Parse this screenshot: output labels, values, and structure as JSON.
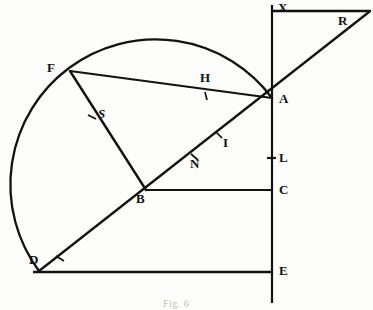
{
  "figure": {
    "caption": "Fig. 6",
    "ink_color": "#121212",
    "background_color": "#fdfdfb",
    "width": 373,
    "height": 310,
    "labels": {
      "x": "X",
      "r": "R",
      "f": "F",
      "a": "A",
      "s": "S",
      "h": "H",
      "i": "I",
      "n": "N",
      "l": "L",
      "b": "B",
      "c": "C",
      "d": "D",
      "e": "E"
    },
    "points": {
      "X": {
        "x": 272,
        "y": 6
      },
      "R": {
        "x": 366,
        "y": 11
      },
      "F": {
        "x": 70,
        "y": 71
      },
      "A": {
        "x": 272,
        "y": 98
      },
      "S": {
        "x": 93,
        "y": 118
      },
      "H": {
        "x": 207,
        "y": 88
      },
      "I": {
        "x": 219,
        "y": 136
      },
      "N": {
        "x": 197,
        "y": 155
      },
      "L": {
        "x": 272,
        "y": 158
      },
      "B": {
        "x": 146,
        "y": 190
      },
      "C": {
        "x": 272,
        "y": 190
      },
      "D": {
        "x": 39,
        "y": 271
      },
      "E": {
        "x": 272,
        "y": 271
      }
    },
    "arc": {
      "center_x": 141,
      "center_y": 169,
      "radius": 131,
      "start_point": "D",
      "end_point": "A",
      "apex_x": 155,
      "apex_y": 38
    },
    "segments": [
      {
        "name": "vertical-axis-XE",
        "from": "X",
        "to": "bottom"
      },
      {
        "name": "top-horizontal-XR",
        "from": "X",
        "to": "R"
      },
      {
        "name": "diagonal-DAR",
        "from": "D",
        "to": "R"
      },
      {
        "name": "chord-FA",
        "from": "F",
        "to": "A"
      },
      {
        "name": "chord-FB",
        "from": "F",
        "to": "B"
      },
      {
        "name": "horizontal-BC",
        "from": "B",
        "to": "C"
      },
      {
        "name": "bottom-horizontal-DE",
        "from": "D",
        "to": "E"
      }
    ],
    "tick_marks": [
      {
        "name": "tick-H",
        "on": "chord-FA"
      },
      {
        "name": "tick-S",
        "on": "chord-FB"
      },
      {
        "name": "tick-I",
        "on": "diagonal-DAR"
      },
      {
        "name": "tick-N",
        "on": "diagonal-DAR"
      },
      {
        "name": "tick-L",
        "on": "vertical-axis-XE"
      },
      {
        "name": "tick-D-mid",
        "on": "diagonal-DAR"
      }
    ]
  }
}
